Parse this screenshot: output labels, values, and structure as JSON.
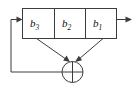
{
  "diagram": {
    "type": "lfsr-block-diagram",
    "stroke_color": "#3c3c3c",
    "label_color": "#101010",
    "background_color": "#ffffff",
    "registers": [
      {
        "id": "b3",
        "base": "b",
        "subscript": "3",
        "label": "b3"
      },
      {
        "id": "b2",
        "base": "b",
        "subscript": "2",
        "label": "b2"
      },
      {
        "id": "b1",
        "base": "b",
        "subscript": "1",
        "label": "b1"
      }
    ],
    "gate": {
      "id": "xor",
      "symbol": "⊕",
      "name": "xor-gate"
    },
    "connections": [
      {
        "name": "input-arrow",
        "from": "feedback",
        "to": "b3",
        "direction": "right"
      },
      {
        "name": "output-arrow",
        "from": "b1",
        "to": "output",
        "direction": "right"
      },
      {
        "name": "tap-b3",
        "from": "b3",
        "to": "xor"
      },
      {
        "name": "tap-b1",
        "from": "b1",
        "to": "xor"
      },
      {
        "name": "feedback-path",
        "from": "xor",
        "to": "input-arrow"
      }
    ]
  }
}
